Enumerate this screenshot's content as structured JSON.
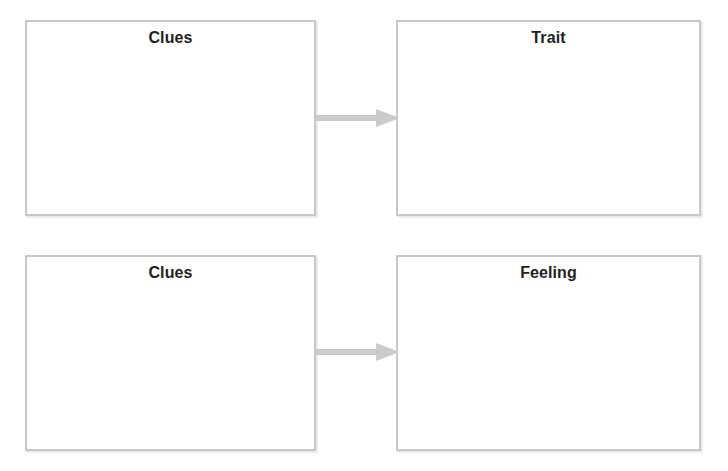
{
  "worksheet": {
    "title": "Inference Graphic Organizer",
    "accent_color": "#c6c8ca",
    "text_color": "#231f20",
    "background_color": "#ffffff",
    "arrow_color": "#c9cbcd",
    "rows": [
      {
        "source": {
          "label": "Clues",
          "content": ""
        },
        "arrow": {
          "icon": "arrow-right-icon",
          "direction": "right"
        },
        "target": {
          "label": "Trait",
          "content": ""
        }
      },
      {
        "source": {
          "label": "Clues",
          "content": ""
        },
        "arrow": {
          "icon": "arrow-right-icon",
          "direction": "right"
        },
        "target": {
          "label": "Feeling",
          "content": ""
        }
      }
    ]
  }
}
